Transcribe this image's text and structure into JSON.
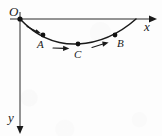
{
  "figure": {
    "type": "coordinate-diagram",
    "background_color": "#fdfdfd",
    "ink_color": "#1a1a1a",
    "axes": {
      "origin": {
        "label": "O",
        "x": 20,
        "y": 19
      },
      "x_axis": {
        "label": "x",
        "direction": "right",
        "start_x": 10,
        "end_x": 153,
        "y": 19,
        "arrow": "arrowhead-right"
      },
      "y_axis": {
        "label": "y",
        "direction": "down",
        "x": 20,
        "start_y": 12,
        "end_y": 131,
        "arrow": "arrowhead-down"
      }
    },
    "curve": {
      "name": "trajectory-path",
      "start": {
        "x": 20,
        "y": 19
      },
      "end": {
        "x": 136,
        "y": 19
      },
      "lowest_point": {
        "x": 78,
        "y": 44
      },
      "path": "M 20 19 C 38 38, 58 45, 78 44 C 98 43, 119 34, 136 19"
    },
    "points": [
      {
        "label": "A",
        "x": 43,
        "y": 35,
        "label_x": 37,
        "label_y": 39
      },
      {
        "label": "C",
        "x": 78,
        "y": 44,
        "label_x": 74,
        "label_y": 49
      },
      {
        "label": "B",
        "x": 115,
        "y": 35,
        "label_x": 117,
        "label_y": 38
      }
    ],
    "direction_arrows": [
      {
        "name": "arrow-O-to-A",
        "x1": 28,
        "y1": 27,
        "x2": 40,
        "y2": 33
      },
      {
        "name": "arrow-A-to-C",
        "x1": 55,
        "y1": 44,
        "x2": 71,
        "y2": 46
      },
      {
        "name": "arrow-C-to-B",
        "x1": 108,
        "y1": 40,
        "x2": 92,
        "y2": 45
      }
    ]
  }
}
